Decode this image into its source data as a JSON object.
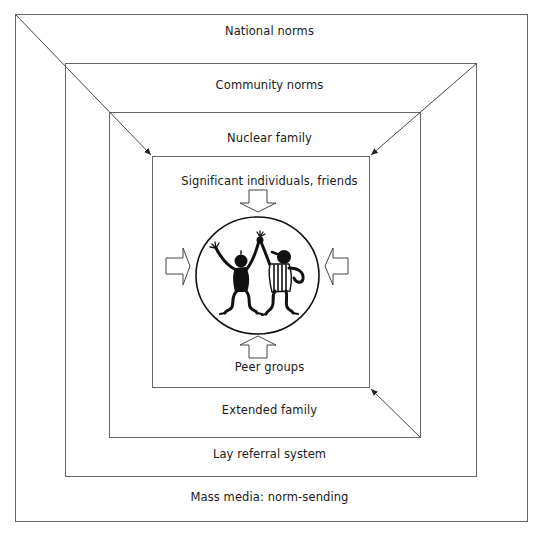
{
  "diagram": {
    "colors": {
      "line": "#555555",
      "ink": "#111111",
      "background": "#ffffff"
    },
    "layers": [
      {
        "id": "outer",
        "top_label": "National norms",
        "bottom_label": "Mass media: norm-sending"
      },
      {
        "id": "second",
        "top_label": "Community norms",
        "bottom_label": "Lay referral system"
      },
      {
        "id": "third",
        "top_label": "Nuclear family",
        "bottom_label": "Extended family"
      },
      {
        "id": "inner",
        "top_label": "Significant individuals, friends",
        "bottom_label": "Peer groups"
      }
    ],
    "center": {
      "illustration": "two-dancing-figures",
      "inward_arrows": [
        "top",
        "right",
        "bottom",
        "left"
      ]
    },
    "connector_arrows": [
      {
        "from": "outer-top-left-corner",
        "to": "inner-top-left-corner"
      },
      {
        "from": "second-top-right-corner",
        "to": "inner-top-right-corner"
      },
      {
        "from": "third-bottom-right-corner",
        "to": "inner-bottom-right-corner"
      }
    ]
  }
}
